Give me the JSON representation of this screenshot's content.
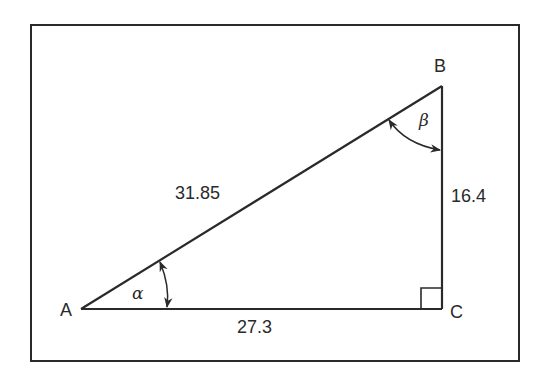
{
  "figure": {
    "type": "right-triangle",
    "frame": {
      "x": 31,
      "y": 25,
      "width": 488,
      "height": 336,
      "stroke": "#2a2a2a"
    },
    "vertices": {
      "A": {
        "label": "A",
        "x": 81,
        "y": 309
      },
      "B": {
        "label": "B",
        "x": 442,
        "y": 86
      },
      "C": {
        "label": "C",
        "x": 442,
        "y": 309
      }
    },
    "sides": {
      "AB": {
        "label": "31.85",
        "name": "hypotenuse"
      },
      "BC": {
        "label": "16.4",
        "name": "opposite-to-alpha"
      },
      "AC": {
        "label": "27.3",
        "name": "adjacent-to-alpha"
      }
    },
    "angles": {
      "alpha": {
        "symbol": "α",
        "vertex": "A"
      },
      "beta": {
        "symbol": "β",
        "vertex": "B"
      },
      "right": {
        "vertex": "C"
      }
    },
    "line_color": "#2a2a2a"
  }
}
